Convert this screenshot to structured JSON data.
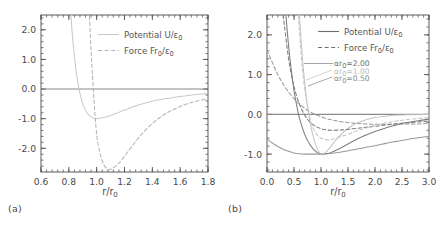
{
  "figure": {
    "panels": [
      {
        "tag": "(a)",
        "xlabel_num": "r/r",
        "xlabel_sub": "0",
        "xticks": [
          "0.6",
          "0.8",
          "1.0",
          "1.2",
          "1.4",
          "1.6",
          "1.8"
        ],
        "yticks": [
          "2.0",
          "1.0",
          "0.0",
          "-1.0",
          "-2.0"
        ],
        "legend": [
          {
            "label_main": "Potential U/",
            "label_sym": "ε",
            "label_sub": "0",
            "style": "solid"
          },
          {
            "label_main": "Force Fr",
            "label_sub1": "0",
            "label_mid": "/",
            "label_sym": "ε",
            "label_sub": "0",
            "style": "dashed"
          }
        ]
      },
      {
        "tag": "(b)",
        "xlabel_num": "r/r",
        "xlabel_sub": "0",
        "xticks": [
          "0.0",
          "0.5",
          "1.0",
          "1.5",
          "2.0",
          "2.5",
          "3.0"
        ],
        "yticks": [
          "2.0",
          "1.0",
          "0.0",
          "-1.0"
        ],
        "legend": [
          {
            "label_main": "Potential U/",
            "label_sym": "ε",
            "label_sub": "0",
            "style": "solid"
          },
          {
            "label_main": "Force Fr",
            "label_sub1": "0",
            "label_mid": "/",
            "label_sym": "ε",
            "label_sub": "0",
            "style": "dashed"
          }
        ],
        "annotations": [
          {
            "sym": "αr",
            "sub": "0",
            "eq": "=2.00",
            "color": "#707070"
          },
          {
            "sym": "αr",
            "sub": "0",
            "eq": "=1.00",
            "color": "#bcbcbc"
          },
          {
            "sym": "αr",
            "sub": "0",
            "eq": "=0.50",
            "color": "#8a8a8a"
          }
        ]
      }
    ]
  },
  "chart_data": [
    {
      "type": "line",
      "panel": "(a)",
      "title": "",
      "xlabel": "r/r0",
      "ylabel": "",
      "xlim": [
        0.6,
        1.8
      ],
      "ylim": [
        -2.8,
        2.5
      ],
      "grid": false,
      "legend_position": "upper-right",
      "xticks": [
        0.6,
        0.8,
        1.0,
        1.2,
        1.4,
        1.6,
        1.8
      ],
      "yticks": [
        2.0,
        1.0,
        0.0,
        -1.0,
        -2.0
      ],
      "series": [
        {
          "name": "Potential U/eps0",
          "style": "solid",
          "color": "#c9c9c9",
          "x": [
            0.8,
            0.82,
            0.84,
            0.86,
            0.88,
            0.9,
            0.92,
            0.94,
            0.96,
            0.98,
            1.0,
            1.05,
            1.1,
            1.15,
            1.2,
            1.3,
            1.4,
            1.5,
            1.6,
            1.7,
            1.8
          ],
          "y": [
            3.59,
            2.14,
            1.1,
            0.36,
            -0.15,
            -0.5,
            -0.72,
            -0.86,
            -0.94,
            -0.99,
            -1.0,
            -0.96,
            -0.89,
            -0.8,
            -0.71,
            -0.54,
            -0.41,
            -0.32,
            -0.25,
            -0.19,
            -0.15
          ]
        },
        {
          "name": "Force Fr0/eps0",
          "style": "dashed",
          "color": "#b5b5b5",
          "x": [
            0.94,
            0.96,
            0.98,
            1.0,
            1.02,
            1.04,
            1.06,
            1.08,
            1.1,
            1.15,
            1.2,
            1.3,
            1.4,
            1.5,
            1.6,
            1.7,
            1.8
          ],
          "y": [
            3.27,
            1.28,
            -0.29,
            -1.54,
            -2.07,
            -2.43,
            -2.62,
            -2.7,
            -2.71,
            -2.55,
            -2.27,
            -1.65,
            -1.16,
            -0.82,
            -0.59,
            -0.43,
            -0.32
          ]
        }
      ]
    },
    {
      "type": "line",
      "panel": "(b)",
      "title": "",
      "xlabel": "r/r0",
      "ylabel": "",
      "xlim": [
        0.0,
        3.0
      ],
      "ylim": [
        -1.45,
        2.5
      ],
      "grid": false,
      "legend_position": "upper-right",
      "xticks": [
        0.0,
        0.5,
        1.0,
        1.5,
        2.0,
        2.5,
        3.0
      ],
      "yticks": [
        2.0,
        1.0,
        0.0,
        -1.0
      ],
      "annotations": [
        "alpha*r0=2.00",
        "alpha*r0=1.00",
        "alpha*r0=0.50"
      ],
      "series": [
        {
          "name": "Potential alpha_r0=0.50",
          "style": "solid",
          "color": "#9a9a9a",
          "x": [
            0.0,
            0.1,
            0.2,
            0.3,
            0.4,
            0.5,
            0.6,
            0.7,
            0.8,
            0.9,
            1.0,
            1.2,
            1.4,
            1.6,
            1.8,
            2.0,
            2.2,
            2.4,
            2.6,
            2.8,
            3.0
          ],
          "y": [
            -0.62,
            -0.72,
            -0.81,
            -0.88,
            -0.93,
            -0.97,
            -0.99,
            -1.0,
            -1.0,
            -1.0,
            -1.0,
            -0.98,
            -0.94,
            -0.89,
            -0.84,
            -0.79,
            -0.73,
            -0.68,
            -0.63,
            -0.59,
            -0.55
          ]
        },
        {
          "name": "Potential alpha_r0=1.00",
          "style": "solid",
          "color": "#7c7c7c",
          "x": [
            0.35,
            0.4,
            0.45,
            0.5,
            0.55,
            0.6,
            0.7,
            0.8,
            0.9,
            1.0,
            1.1,
            1.2,
            1.4,
            1.6,
            1.8,
            2.0,
            2.2,
            2.5,
            2.8,
            3.0
          ],
          "y": [
            2.5,
            1.72,
            1.1,
            0.6,
            0.22,
            -0.09,
            -0.51,
            -0.77,
            -0.93,
            -1.0,
            -0.99,
            -0.95,
            -0.82,
            -0.67,
            -0.54,
            -0.43,
            -0.34,
            -0.23,
            -0.16,
            -0.12
          ]
        },
        {
          "name": "Potential alpha_r0=2.00",
          "style": "solid",
          "color": "#c5c5c5",
          "x": [
            0.6,
            0.64,
            0.68,
            0.72,
            0.76,
            0.8,
            0.85,
            0.9,
            0.95,
            1.0,
            1.05,
            1.1,
            1.2,
            1.3,
            1.5,
            1.7,
            2.0,
            2.3,
            2.6,
            3.0
          ],
          "y": [
            2.5,
            1.7,
            1.05,
            0.52,
            0.12,
            -0.22,
            -0.53,
            -0.76,
            -0.92,
            -1.0,
            -0.99,
            -0.94,
            -0.78,
            -0.61,
            -0.35,
            -0.2,
            -0.08,
            -0.03,
            -0.01,
            0.0
          ]
        },
        {
          "name": "Force alpha_r0=0.50",
          "style": "dashed",
          "color": "#9a9a9a",
          "x": [
            0.0,
            0.2,
            0.4,
            0.6,
            0.8,
            1.0,
            1.2,
            1.4,
            1.6,
            1.8,
            2.0,
            2.2,
            2.4,
            2.6,
            2.8,
            3.0
          ],
          "y": [
            1.62,
            1.0,
            0.56,
            0.26,
            0.06,
            -0.06,
            -0.14,
            -0.19,
            -0.22,
            -0.24,
            -0.25,
            -0.25,
            -0.25,
            -0.24,
            -0.24,
            -0.23
          ]
        },
        {
          "name": "Force alpha_r0=1.00",
          "style": "dashed",
          "color": "#7c7c7c",
          "x": [
            0.3,
            0.4,
            0.5,
            0.6,
            0.7,
            0.8,
            0.9,
            1.0,
            1.1,
            1.2,
            1.4,
            1.6,
            1.8,
            2.0,
            2.3,
            2.6,
            3.0
          ],
          "y": [
            2.5,
            1.4,
            0.7,
            0.26,
            -0.02,
            -0.2,
            -0.3,
            -0.36,
            -0.39,
            -0.4,
            -0.39,
            -0.36,
            -0.33,
            -0.3,
            -0.25,
            -0.21,
            -0.17
          ]
        },
        {
          "name": "Force alpha_r0=2.00",
          "style": "dashed",
          "color": "#c5c5c5",
          "x": [
            0.58,
            0.64,
            0.7,
            0.76,
            0.82,
            0.88,
            0.95,
            1.0,
            1.1,
            1.2,
            1.35,
            1.5,
            1.7,
            2.0,
            2.3,
            2.6,
            3.0
          ],
          "y": [
            2.5,
            1.38,
            0.62,
            0.12,
            -0.22,
            -0.42,
            -0.55,
            -0.6,
            -0.64,
            -0.63,
            -0.57,
            -0.5,
            -0.4,
            -0.28,
            -0.19,
            -0.13,
            -0.08
          ]
        }
      ]
    }
  ]
}
